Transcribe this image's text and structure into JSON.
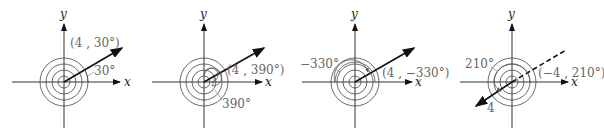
{
  "figure": {
    "panels": [
      {
        "x_axis_label": "x",
        "y_axis_label": "y",
        "point_label": "(4 , 30°)",
        "angle_label": "30°",
        "r": 4,
        "theta_deg": 30
      },
      {
        "x_axis_label": "x",
        "y_axis_label": "y",
        "point_label": "(4 , 390°)",
        "angle_label": "390°",
        "r": 4,
        "theta_deg": 390
      },
      {
        "x_axis_label": "x",
        "y_axis_label": "y",
        "point_label": "(4 , −330°)",
        "angle_label": "−330°",
        "r": 4,
        "theta_deg": -330
      },
      {
        "x_axis_label": "x",
        "y_axis_label": "y",
        "point_label": "(−4 , 210°)",
        "angle_label": "210°",
        "radius_label": "4",
        "r": -4,
        "theta_deg": 210
      }
    ]
  }
}
